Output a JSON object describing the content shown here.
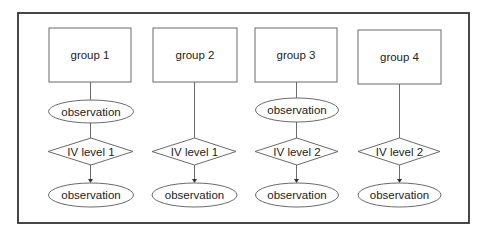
{
  "diagram": {
    "title": "",
    "columns": [
      {
        "group_label": "group 1",
        "has_pre_observation": true,
        "pre_observation_label": "observation",
        "treatment_label": "IV level 1",
        "post_observation_label": "observation"
      },
      {
        "group_label": "group 2",
        "has_pre_observation": false,
        "pre_observation_label": "",
        "treatment_label": "IV level 1",
        "post_observation_label": "observation"
      },
      {
        "group_label": "group 3",
        "has_pre_observation": true,
        "pre_observation_label": "observation",
        "treatment_label": "IV level 2",
        "post_observation_label": "observation"
      },
      {
        "group_label": "group 4",
        "has_pre_observation": false,
        "pre_observation_label": "",
        "treatment_label": "IV level 2",
        "post_observation_label": "observation"
      }
    ],
    "colors": {
      "frame_stroke": "#333333",
      "shape_stroke": "#6a6a6a",
      "text": "#222222",
      "background": "#ffffff"
    }
  }
}
